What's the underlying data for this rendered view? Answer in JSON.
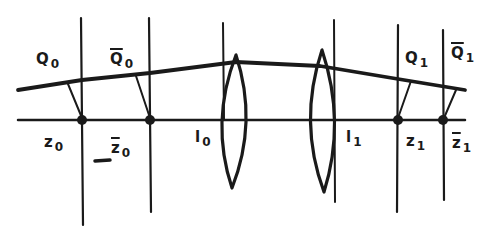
{
  "diagram": {
    "type": "optical lens system with ray trace",
    "colors": {
      "ink": "#1a1a1a",
      "background": "#ffffff"
    },
    "labels": [
      {
        "id": "Q0",
        "base": "Q",
        "sub": "0",
        "overline": false,
        "x": 38,
        "y": 52
      },
      {
        "id": "Q0bar",
        "base": "Q",
        "sub": "0",
        "overline": true,
        "x": 110,
        "y": 52
      },
      {
        "id": "Q1",
        "base": "Q",
        "sub": "1",
        "overline": false,
        "x": 406,
        "y": 50
      },
      {
        "id": "Q1bar",
        "base": "Q",
        "sub": "1",
        "overline": true,
        "x": 451,
        "y": 44
      },
      {
        "id": "z0",
        "base": "z",
        "sub": "0",
        "overline": false,
        "x": 44,
        "y": 136
      },
      {
        "id": "z0bar",
        "base": "z",
        "sub": "0",
        "overline": true,
        "x": 111,
        "y": 145
      },
      {
        "id": "l0",
        "base": "l",
        "sub": "0",
        "overline": false,
        "x": 194,
        "y": 130
      },
      {
        "id": "l1",
        "base": "l",
        "sub": "1",
        "overline": false,
        "x": 345,
        "y": 130
      },
      {
        "id": "z1",
        "base": "z",
        "sub": "1",
        "overline": false,
        "x": 407,
        "y": 135
      },
      {
        "id": "z1bar",
        "base": "z",
        "sub": "1",
        "overline": true,
        "x": 452,
        "y": 138
      }
    ],
    "dash_mark": "_"
  }
}
